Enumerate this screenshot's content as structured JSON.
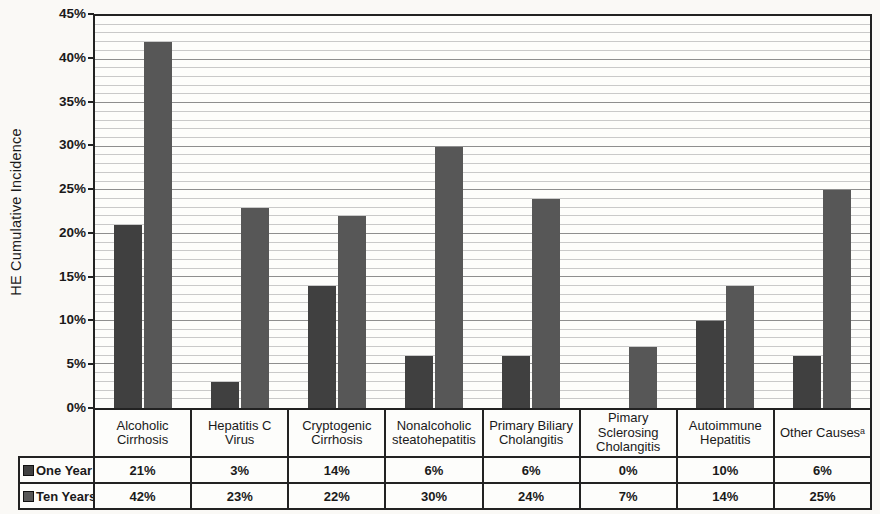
{
  "chart_data": {
    "type": "bar",
    "title": "",
    "ylabel": "HE Cumulative Incidence",
    "xlabel": "",
    "ylim": [
      0,
      45
    ],
    "y_major_step": 5,
    "y_minor_step": 1,
    "y_ticks": [
      "0%",
      "5%",
      "10%",
      "15%",
      "20%",
      "25%",
      "30%",
      "35%",
      "40%",
      "45%"
    ],
    "grid": "major and minor horizontal gridlines",
    "legend_position": "row labels at left of attached data table",
    "value_suffix": "%",
    "categories": [
      "Alcoholic Cirrhosis",
      "Hepatitis C Virus",
      "Cryptogenic Cirrhosis",
      "Nonalcoholic steatohepatitis",
      "Primary Biliary Cholangitis",
      "Pimary Sclerosing Cholangitis",
      "Autoimmune Hepatitis",
      "Other Causesᵃ"
    ],
    "series": [
      {
        "name": "One Year",
        "color": "#404040",
        "values": [
          21,
          3,
          14,
          6,
          6,
          0,
          10,
          6
        ]
      },
      {
        "name": "Ten Years",
        "color": "#575757",
        "values": [
          42,
          23,
          22,
          30,
          24,
          7,
          14,
          25
        ]
      }
    ]
  },
  "colors": {
    "axis": "#222222",
    "grid_minor": "#c9c9c9",
    "grid_major": "#8e8e8e",
    "table_border": "#222222",
    "text": "#1a1a1a",
    "plot_background": "#fdfdfb"
  }
}
